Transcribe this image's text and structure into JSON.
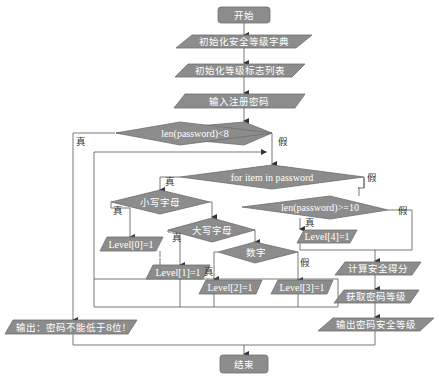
{
  "colors": {
    "shape_fill": "#8c8c8c",
    "shape_stroke": "#6e6e6e",
    "line": "#555555",
    "shape_text": "#ffffff",
    "label_text": "#333333",
    "background": "#ffffff"
  },
  "nodes": {
    "start": {
      "type": "terminator",
      "label": "开始"
    },
    "init_dict": {
      "type": "process",
      "label": "初始化安全等级字典"
    },
    "init_flags": {
      "type": "process",
      "label": "初始化等级标志列表"
    },
    "input_pwd": {
      "type": "io",
      "label": "输入注册密码"
    },
    "check_len8": {
      "type": "decision",
      "label": "len(password)<8"
    },
    "for_loop": {
      "type": "decision",
      "label": "for item in password"
    },
    "is_lower": {
      "type": "decision",
      "label": "小写字母"
    },
    "is_upper": {
      "type": "decision",
      "label": "大写字母"
    },
    "is_digit": {
      "type": "decision",
      "label": "数字"
    },
    "level0": {
      "type": "process",
      "label": "Level[0]=1"
    },
    "level1": {
      "type": "process",
      "label": "Level[1]=1"
    },
    "level2": {
      "type": "process",
      "label": "Level[2]=1"
    },
    "level3": {
      "type": "process",
      "label": "Level[3]=1"
    },
    "check_len10": {
      "type": "decision",
      "label": "len(password)>=10"
    },
    "level4": {
      "type": "process",
      "label": "Level[4]=1"
    },
    "calc_score": {
      "type": "process",
      "label": "计算安全得分"
    },
    "get_level": {
      "type": "process",
      "label": "获取密码等级"
    },
    "output_level": {
      "type": "io",
      "label": "输出密码安全等级"
    },
    "output_short": {
      "type": "io",
      "label": "输出：密码不能低于8位!"
    },
    "end": {
      "type": "terminator",
      "label": "结束"
    }
  },
  "edge_labels": {
    "len8_true": "真",
    "len8_false": "假",
    "for_true": "真",
    "for_false": "假",
    "lower_true": "真",
    "upper_true": "真",
    "digit_true": "真",
    "digit_false": "假",
    "len10_true": "真",
    "len10_false": "假"
  }
}
